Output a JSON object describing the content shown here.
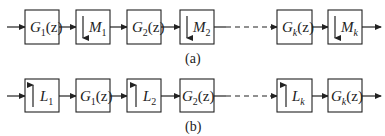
{
  "diagram": {
    "row_a": {
      "caption": "(a)",
      "blocks": [
        {
          "kind": "filter",
          "main": "G",
          "sub": "1",
          "arg": "(z)"
        },
        {
          "kind": "downsample",
          "main": "M",
          "sub": "1"
        },
        {
          "kind": "filter",
          "main": "G",
          "sub": "2",
          "arg": "(z)"
        },
        {
          "kind": "downsample",
          "main": "M",
          "sub": "2"
        },
        {
          "kind": "filter",
          "main": "G",
          "sub": "k",
          "arg": "(z)"
        },
        {
          "kind": "downsample",
          "main": "M",
          "sub": "k"
        }
      ]
    },
    "row_b": {
      "caption": "(b)",
      "blocks": [
        {
          "kind": "upsample",
          "main": "L",
          "sub": "1"
        },
        {
          "kind": "filter",
          "main": "G",
          "sub": "1",
          "arg": "(z)"
        },
        {
          "kind": "upsample",
          "main": "L",
          "sub": "2"
        },
        {
          "kind": "filter",
          "main": "G",
          "sub": "2",
          "arg": "(z)"
        },
        {
          "kind": "upsample",
          "main": "L",
          "sub": "k"
        },
        {
          "kind": "filter",
          "main": "G",
          "sub": "k",
          "arg": "(z)"
        }
      ]
    }
  }
}
